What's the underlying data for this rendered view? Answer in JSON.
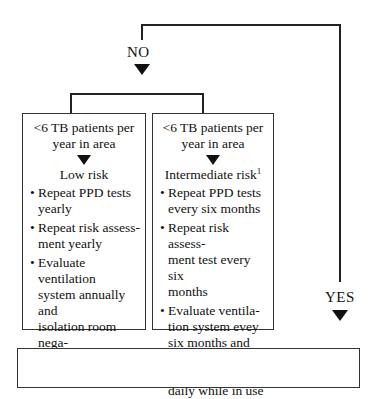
{
  "diagram": {
    "type": "flowchart",
    "branches": {
      "no_label": "NO",
      "yes_label": "YES"
    },
    "boxes": [
      {
        "id": "low-risk",
        "header_line1": "<6 TB patients per",
        "header_line2": "year in area",
        "risk": "Low risk",
        "footnote_marker": "",
        "bullets": [
          [
            "Repeat PPD tests",
            "yearly"
          ],
          [
            "Repeat risk assess-",
            "ment yearly"
          ],
          [
            "Evaluate ventilation",
            "system annually and",
            "isolation room nega-",
            "tive pressure daily",
            "while in use"
          ]
        ]
      },
      {
        "id": "intermediate-risk",
        "header_line1": "<6 TB patients per",
        "header_line2": "year in area",
        "risk": "Intermediate  risk",
        "footnote_marker": "1",
        "bullets": [
          [
            "Repeat PPD tests",
            "every six months"
          ],
          [
            "Repeat risk assess-",
            "ment test every six",
            "months"
          ],
          [
            "Evaluate ventila-",
            "tion system evey",
            "six months and",
            "isolation room",
            "negative pressure",
            "daily while in use"
          ]
        ]
      }
    ],
    "colors": {
      "line": "#222222",
      "border": "#333333",
      "text": "#111111",
      "background": "#ffffff"
    }
  }
}
